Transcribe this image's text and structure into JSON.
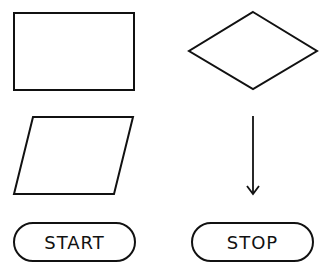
{
  "diagram": {
    "stroke_color": "#111111",
    "background": "#ffffff",
    "shapes": [
      {
        "name": "process-rectangle",
        "type": "rectangle",
        "label": ""
      },
      {
        "name": "decision-diamond",
        "type": "diamond",
        "label": ""
      },
      {
        "name": "input-output-parallelogram",
        "type": "parallelogram",
        "label": ""
      },
      {
        "name": "flow-arrow",
        "type": "arrow",
        "direction": "down",
        "label": ""
      },
      {
        "name": "start-terminator",
        "type": "terminator",
        "label": "START"
      },
      {
        "name": "stop-terminator",
        "type": "terminator",
        "label": "STOP"
      }
    ]
  }
}
